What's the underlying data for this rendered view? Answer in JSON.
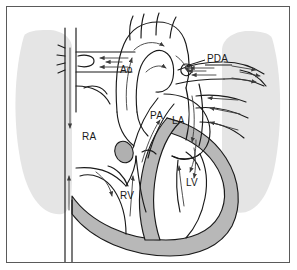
{
  "figure": {
    "type": "medical-anatomical-diagram",
    "frame_border_color": "#5a5a5a",
    "background_color": "#ffffff"
  },
  "colors": {
    "myocardium_gray": "#b8b8b8",
    "lung_shadow_gray": "#e4e4e4",
    "outline_black": "#1a1a1a",
    "flow_arrow_gray": "#4a4a4a",
    "vegetation_gray": "#b0b0b0"
  },
  "labels": [
    {
      "id": "ao",
      "text": "Ao",
      "meaning": "aorta",
      "x": 120,
      "y": 73
    },
    {
      "id": "pda",
      "text": "PDA",
      "meaning": "patent ductus arteriosus",
      "x": 207,
      "y": 62
    },
    {
      "id": "pa",
      "text": "PA",
      "meaning": "pulmonary artery",
      "x": 150,
      "y": 119
    },
    {
      "id": "la",
      "text": "LA",
      "meaning": "left atrium",
      "x": 172,
      "y": 124
    },
    {
      "id": "ra",
      "text": "RA",
      "meaning": "right atrium",
      "x": 82,
      "y": 140
    },
    {
      "id": "rv",
      "text": "RV",
      "meaning": "right ventricle",
      "x": 120,
      "y": 199
    },
    {
      "id": "lv",
      "text": "LV",
      "meaning": "left ventricle",
      "x": 186,
      "y": 186
    }
  ],
  "structures": [
    {
      "name": "left-lung-shadow",
      "type": "lung-silhouette"
    },
    {
      "name": "right-lung-shadow",
      "type": "lung-silhouette"
    },
    {
      "name": "aortic-arch",
      "type": "great-vessel"
    },
    {
      "name": "head-neck-vessels",
      "type": "great-vessel"
    },
    {
      "name": "superior-vena-cava",
      "type": "great-vessel"
    },
    {
      "name": "inferior-vena-cava",
      "type": "great-vessel"
    },
    {
      "name": "pulmonary-trunk",
      "type": "great-vessel"
    },
    {
      "name": "ductus-arteriosus",
      "type": "shunt"
    },
    {
      "name": "myocardium",
      "type": "cardiac-muscle"
    },
    {
      "name": "valve-vegetation",
      "type": "valve-structure"
    }
  ],
  "flow_arrows": {
    "count": 24,
    "description": "directional blood flow arrows through chambers, great vessels and the ductus arteriosus"
  }
}
